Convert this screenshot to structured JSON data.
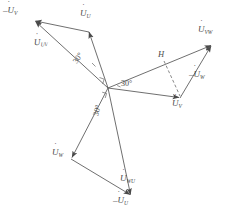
{
  "figure": {
    "kind": "phasor-diagram",
    "stroke_color": "#555555",
    "text_color": "#4a4a4a",
    "background": "#ffffff",
    "width": 235,
    "height": 218
  },
  "origin": {
    "x": 108,
    "y": 88,
    "label": "O"
  },
  "phasors": [
    {
      "name": "U-phase",
      "label_main": "U",
      "label_sub": "U",
      "negative": false,
      "label_text": "U",
      "sub_text": "U",
      "from": {
        "x": 108,
        "y": 88
      },
      "to": {
        "x": 89,
        "y": 32
      },
      "label_pos": {
        "x": 82,
        "y": 12
      }
    },
    {
      "name": "negative-V-phase",
      "label_main": "U",
      "label_sub": "V",
      "negative": true,
      "label_text": "–U",
      "sub_text": "V",
      "from": {
        "x": 89,
        "y": 32
      },
      "to": {
        "x": 34,
        "y": 21
      },
      "label_pos": {
        "x": 3,
        "y": 9
      }
    },
    {
      "name": "UV-line-voltage",
      "label_main": "U",
      "label_sub": "UV",
      "negative": false,
      "label_text": "U",
      "sub_text": "UV",
      "from": {
        "x": 108,
        "y": 88
      },
      "to": {
        "x": 34,
        "y": 21
      },
      "label_pos": {
        "x": 41,
        "y": 43
      }
    },
    {
      "name": "V-phase",
      "label_main": "U",
      "label_sub": "V",
      "negative": false,
      "label_text": "U",
      "sub_text": "V",
      "from": {
        "x": 108,
        "y": 88
      },
      "to": {
        "x": 180,
        "y": 98
      },
      "label_pos": {
        "x": 173,
        "y": 103
      }
    },
    {
      "name": "negative-W-phase",
      "label_main": "U",
      "label_sub": "W",
      "negative": true,
      "label_text": "–U",
      "sub_text": "W",
      "from": {
        "x": 180,
        "y": 98
      },
      "to": {
        "x": 212,
        "y": 45
      },
      "label_pos": {
        "x": 190,
        "y": 74
      }
    },
    {
      "name": "VW-line-voltage",
      "label_main": "U",
      "label_sub": "VW",
      "negative": false,
      "label_text": "U",
      "sub_text": "VW",
      "from": {
        "x": 108,
        "y": 88
      },
      "to": {
        "x": 212,
        "y": 45
      },
      "label_pos": {
        "x": 199,
        "y": 28
      }
    },
    {
      "name": "W-phase",
      "label_main": "U",
      "label_sub": "W",
      "negative": false,
      "label_text": "U",
      "sub_text": "W",
      "from": {
        "x": 108,
        "y": 88
      },
      "to": {
        "x": 71,
        "y": 159
      },
      "label_pos": {
        "x": 54,
        "y": 152
      }
    },
    {
      "name": "negative-U-phase",
      "label_main": "U",
      "label_sub": "U",
      "negative": true,
      "label_text": "–U",
      "sub_text": "U",
      "from": {
        "x": 71,
        "y": 159
      },
      "to": {
        "x": 131,
        "y": 196
      },
      "label_pos": {
        "x": 115,
        "y": 199
      }
    },
    {
      "name": "WU-line-voltage",
      "label_main": "U",
      "label_sub": "WU",
      "negative": false,
      "label_text": "U",
      "sub_text": "WU",
      "from": {
        "x": 108,
        "y": 88
      },
      "to": {
        "x": 131,
        "y": 196
      },
      "label_pos": {
        "x": 122,
        "y": 177
      }
    }
  ],
  "angles": [
    {
      "name": "angle-upper-left",
      "value": "30°",
      "pos": {
        "x": 78,
        "y": 62
      },
      "rotation_class": "rot-left"
    },
    {
      "name": "angle-right",
      "value": "30°",
      "pos": {
        "x": 122,
        "y": 82
      },
      "rotation_class": ""
    },
    {
      "name": "angle-lower",
      "value": "30°",
      "pos": {
        "x": 99,
        "y": 113
      },
      "rotation_class": "rot-down"
    }
  ],
  "annotations": [
    {
      "name": "height-label",
      "text": "H",
      "pos": {
        "x": 159,
        "y": 54
      }
    }
  ],
  "dashed_lines": [
    {
      "name": "perpendicular-height",
      "from": {
        "x": 165,
        "y": 62
      },
      "to": {
        "x": 180,
        "y": 97
      }
    }
  ],
  "right_angle_marks": [
    {
      "name": "right-angle-upper",
      "pos": {
        "x": 101,
        "y": 80
      }
    },
    {
      "name": "right-angle-lower",
      "pos": {
        "x": 104,
        "y": 95
      }
    }
  ]
}
